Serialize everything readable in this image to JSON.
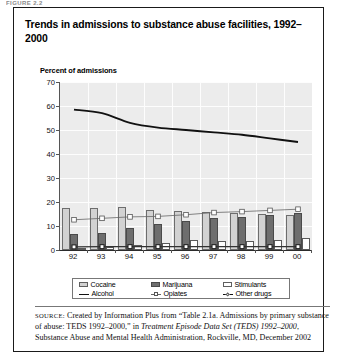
{
  "top_cut_text": "FIGURE 2.2",
  "figure": {
    "title": "Trends in admissions to substance abuse facilities, 1992–2000",
    "axis_title": "Percent of admissions"
  },
  "legend": {
    "items": [
      {
        "label": "Cocaine",
        "marker": "bar-light-gray"
      },
      {
        "label": "Marijuana",
        "marker": "bar-dark-gray"
      },
      {
        "label": "Stimulants",
        "marker": "bar-white"
      },
      {
        "label": "Alcohol",
        "marker": "line-solid-black"
      },
      {
        "label": "Opiates",
        "marker": "line-square-marker"
      },
      {
        "label": "Other drugs",
        "marker": "line-diamond-marker"
      }
    ]
  },
  "source": {
    "label": "SOURCE:",
    "text_1": " Created by Information Plus from “Table 2.1a. Admissions by primary substance of abuse: TEDS 1992–2000,” in ",
    "italic_1": "Treatment Episode Data Set (TEDS) 1992–2000",
    "text_2": ", Substance Abuse and Mental Health Administration, Rockville, MD, December 2002"
  },
  "colors": {
    "cocaine": "#d2d2d2",
    "marijuana": "#6e6e6e",
    "stimulants": "#ffffff",
    "alcohol": "#111111",
    "opiates": "#666666",
    "other_drugs": "#333333",
    "plot_background": "#ececec",
    "frame_border": "#1a1a1a"
  },
  "chart_data": {
    "type": "bar",
    "title": "Trends in admissions to substance abuse facilities, 1992–2000",
    "xlabel": "",
    "ylabel": "Percent of admissions",
    "ylim": [
      0,
      70
    ],
    "ytick_step": 10,
    "yticks": [
      0,
      10,
      20,
      30,
      40,
      50,
      60,
      70
    ],
    "grid": true,
    "legend_position": "bottom",
    "categories": [
      "92",
      "93",
      "94",
      "95",
      "96",
      "97",
      "98",
      "99",
      "00"
    ],
    "bar_series": [
      {
        "name": "Cocaine",
        "type": "bar",
        "values": [
          17.5,
          17.4,
          18.0,
          16.8,
          16.4,
          15.8,
          15.5,
          15.0,
          14.5
        ]
      },
      {
        "name": "Marijuana",
        "type": "bar",
        "values": [
          6.8,
          7.2,
          9.3,
          10.7,
          12.1,
          13.3,
          13.7,
          14.5,
          15.4
        ]
      },
      {
        "name": "Stimulants",
        "type": "bar",
        "values": [
          1.0,
          1.2,
          2.2,
          3.1,
          4.0,
          3.9,
          3.8,
          4.3,
          4.8
        ]
      }
    ],
    "line_series": [
      {
        "name": "Alcohol",
        "type": "line",
        "values": [
          58.5,
          57.0,
          53.0,
          51.0,
          50.0,
          49.0,
          48.0,
          46.5,
          45.0
        ]
      },
      {
        "name": "Opiates",
        "type": "line",
        "values": [
          12.6,
          13.2,
          13.8,
          14.0,
          14.7,
          15.6,
          16.0,
          16.5,
          17.0
        ]
      },
      {
        "name": "Other drugs",
        "type": "line",
        "values": [
          1.3,
          1.4,
          1.4,
          1.4,
          1.4,
          1.4,
          1.4,
          1.4,
          1.4
        ]
      }
    ]
  }
}
